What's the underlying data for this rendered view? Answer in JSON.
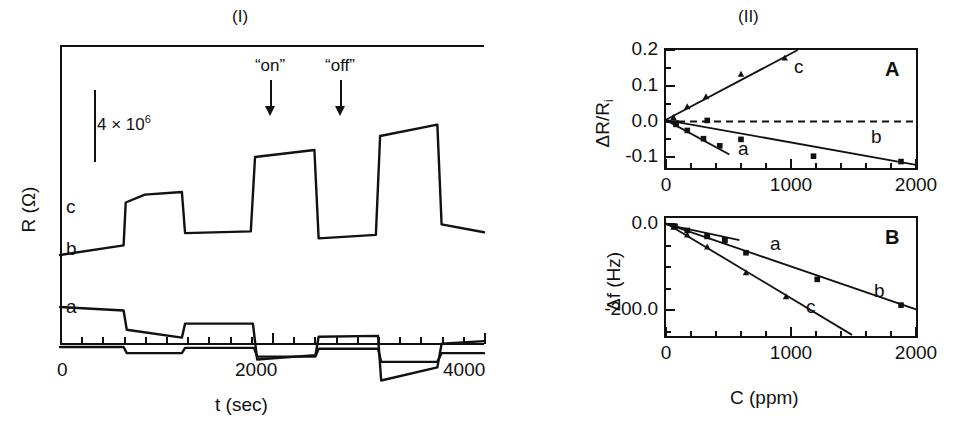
{
  "figure": {
    "panel_I_title": "(I)",
    "panel_II_title": "(II)"
  },
  "panel_I": {
    "ylabel": "R (Ω)",
    "xlabel": "t (sec)",
    "xticks": [
      "0",
      "2000",
      "4000"
    ],
    "scalebar_label_text": "4 × 10",
    "scalebar_exponent": "6",
    "annotations": [
      {
        "name": "on",
        "label": "“on”"
      },
      {
        "name": "off",
        "label": "“off”"
      }
    ],
    "trace_labels": {
      "a": "a",
      "b": "b",
      "c": "c"
    }
  },
  "panel_II": {
    "xlabel": "C (ppm)",
    "xticks": [
      "0",
      "1000",
      "2000"
    ],
    "A": {
      "letter": "A",
      "ylabel": "ΔR/R",
      "ylabel_sub": "i",
      "yticks": [
        "0.2",
        "0.1",
        "0.0",
        "-0.1"
      ],
      "series_labels": {
        "a": "a",
        "b": "b",
        "c": "c"
      }
    },
    "B": {
      "letter": "B",
      "ylabel": "Δf (Hz)",
      "yticks": [
        "0.0",
        "-200.0"
      ],
      "series_labels": {
        "a": "a",
        "b": "b",
        "c": "c"
      }
    }
  },
  "chart_data": [
    {
      "id": "panel-I",
      "type": "line",
      "title": "(I)",
      "xlabel": "t (sec)",
      "ylabel": "R (Ω)",
      "xlim": [
        0,
        4000
      ],
      "xtick_values": [
        0,
        2000,
        4000
      ],
      "xtick_minor_step": 200,
      "yaxis_unlabeled": true,
      "scale_bar": {
        "label": "4 × 10^6",
        "units": "ohm"
      },
      "event_markers": [
        {
          "label": "“on”",
          "t": 1860
        },
        {
          "label": "“off”",
          "t": 2420
        }
      ],
      "grid": false,
      "legend": "inline-curve-labels",
      "series": [
        {
          "name": "c",
          "comment": "resistance rises on exposure; largest response",
          "points": [
            [
              0,
              0.0
            ],
            [
              600,
              0.055
            ],
            [
              620,
              0.3
            ],
            [
              800,
              0.345
            ],
            [
              1150,
              0.36
            ],
            [
              1180,
              0.125
            ],
            [
              1800,
              0.135
            ],
            [
              1840,
              0.56
            ],
            [
              2400,
              0.6
            ],
            [
              2440,
              0.095
            ],
            [
              2980,
              0.115
            ],
            [
              3020,
              0.68
            ],
            [
              3560,
              0.745
            ],
            [
              3600,
              0.175
            ],
            [
              4000,
              0.13
            ]
          ]
        },
        {
          "name": "b",
          "comment": "resistance drops on exposure; intermediate response",
          "points": [
            [
              0,
              0.0
            ],
            [
              600,
              -0.02
            ],
            [
              630,
              -0.13
            ],
            [
              1150,
              -0.175
            ],
            [
              1180,
              -0.095
            ],
            [
              1820,
              -0.095
            ],
            [
              1860,
              -0.3
            ],
            [
              2410,
              -0.275
            ],
            [
              2440,
              -0.17
            ],
            [
              3000,
              -0.165
            ],
            [
              3030,
              -0.42
            ],
            [
              3560,
              -0.345
            ],
            [
              3600,
              -0.21
            ],
            [
              4000,
              -0.195
            ]
          ]
        },
        {
          "name": "a",
          "comment": "smallest response",
          "points": [
            [
              0,
              0.0
            ],
            [
              600,
              0.0
            ],
            [
              630,
              -0.035
            ],
            [
              1150,
              -0.035
            ],
            [
              1180,
              -0.005
            ],
            [
              1830,
              -0.005
            ],
            [
              1860,
              -0.055
            ],
            [
              2410,
              -0.055
            ],
            [
              2440,
              -0.01
            ],
            [
              3000,
              -0.01
            ],
            [
              3030,
              -0.085
            ],
            [
              3560,
              -0.085
            ],
            [
              3600,
              -0.035
            ],
            [
              4000,
              -0.035
            ]
          ]
        }
      ]
    },
    {
      "id": "panel-II-A",
      "type": "scatter",
      "title": "A",
      "xlabel": "C (ppm)",
      "ylabel": "ΔR/R_i",
      "xlim": [
        0,
        2000
      ],
      "ylim": [
        -0.13,
        0.2
      ],
      "xtick_values": [
        0,
        1000,
        2000
      ],
      "xtick_minor_step": 200,
      "ytick_values": [
        0.2,
        0.1,
        0.0,
        -0.1
      ],
      "zero_line": {
        "y": 0.0,
        "style": "dashed"
      },
      "grid": false,
      "series": [
        {
          "name": "c",
          "marker": "triangle",
          "fit_line": {
            "slope": 0.000185,
            "intercept": 0.005
          },
          "points": [
            [
              60,
              0.012
            ],
            [
              170,
              0.042
            ],
            [
              320,
              0.07
            ],
            [
              600,
              0.133
            ],
            [
              950,
              0.178
            ]
          ]
        },
        {
          "name": "b",
          "marker": "square",
          "fit_line": {
            "slope": -6.25e-05,
            "intercept": 0.004
          },
          "points": [
            [
              80,
              -0.004
            ],
            [
              330,
              0.003
            ],
            [
              600,
              -0.05
            ],
            [
              1180,
              -0.097
            ],
            [
              1880,
              -0.112
            ]
          ]
        },
        {
          "name": "a",
          "marker": "square",
          "fit_line": {
            "slope": -0.00019,
            "intercept": 0.004
          },
          "points": [
            [
              80,
              -0.008
            ],
            [
              170,
              -0.025
            ],
            [
              300,
              -0.048
            ],
            [
              430,
              -0.068
            ]
          ]
        }
      ]
    },
    {
      "id": "panel-II-B",
      "type": "scatter",
      "title": "B",
      "xlabel": "C (ppm)",
      "ylabel": "Δf (Hz)",
      "xlim": [
        0,
        2000
      ],
      "ylim": [
        -260,
        15
      ],
      "xtick_values": [
        0,
        1000,
        2000
      ],
      "xtick_minor_step": 200,
      "ytick_values": [
        0.0,
        -200.0
      ],
      "grid": false,
      "series": [
        {
          "name": "c",
          "marker": "triangle",
          "fit_line": {
            "slope": -0.175,
            "intercept": 3
          },
          "points": [
            [
              60,
              -6
            ],
            [
              170,
              -24
            ],
            [
              330,
              -52
            ],
            [
              640,
              -112
            ],
            [
              960,
              -168
            ]
          ]
        },
        {
          "name": "b",
          "marker": "square",
          "fit_line": {
            "slope": -0.1,
            "intercept": 2
          },
          "points": [
            [
              70,
              -4
            ],
            [
              330,
              -28
            ],
            [
              470,
              -38
            ],
            [
              640,
              -66
            ],
            [
              1210,
              -128
            ],
            [
              1880,
              -188
            ]
          ]
        },
        {
          "name": "a",
          "marker": "square",
          "fit_line": {
            "slope": -0.062,
            "intercept": 0
          },
          "points": [
            [
              70,
              -5
            ],
            [
              170,
              -14
            ],
            [
              330,
              -27
            ],
            [
              470,
              -36
            ]
          ]
        }
      ]
    }
  ]
}
